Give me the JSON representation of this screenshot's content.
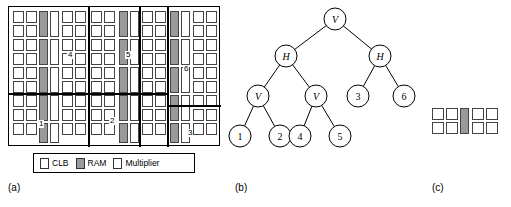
{
  "figure": {
    "captions": {
      "a": "(a)",
      "b": "(b)",
      "c": "(c)"
    }
  },
  "panel_a": {
    "legend": {
      "items": [
        {
          "key": "clb",
          "label": "CLB",
          "color": "#ffffff"
        },
        {
          "key": "ram",
          "label": "RAM",
          "color": "#9a9a9a"
        },
        {
          "key": "multiplier",
          "label": "Multiplier",
          "color": "#ffffff"
        }
      ]
    },
    "region_labels": [
      "1",
      "2",
      "3",
      "4",
      "5",
      "6"
    ]
  },
  "panel_b": {
    "type": "binary-slicing-tree",
    "nodes": [
      {
        "id": "n0",
        "label": "V",
        "italic": true,
        "cx": 107,
        "cy": 15
      },
      {
        "id": "n1",
        "label": "H",
        "italic": true,
        "cx": 58,
        "cy": 52
      },
      {
        "id": "n2",
        "label": "H",
        "italic": true,
        "cx": 152,
        "cy": 52
      },
      {
        "id": "n3",
        "label": "V",
        "italic": true,
        "cx": 30,
        "cy": 92
      },
      {
        "id": "n4",
        "label": "V",
        "italic": true,
        "cx": 88,
        "cy": 92
      },
      {
        "id": "n5",
        "label": "3",
        "italic": false,
        "cx": 130,
        "cy": 92
      },
      {
        "id": "n6",
        "label": "6",
        "italic": false,
        "cx": 176,
        "cy": 92
      },
      {
        "id": "n7",
        "label": "1",
        "italic": false,
        "cx": 12,
        "cy": 132
      },
      {
        "id": "n8",
        "label": "2",
        "italic": false,
        "cx": 52,
        "cy": 132
      },
      {
        "id": "n9",
        "label": "4",
        "italic": false,
        "cx": 72,
        "cy": 132
      },
      {
        "id": "n10",
        "label": "5",
        "italic": false,
        "cx": 112,
        "cy": 132
      }
    ],
    "edges": [
      [
        "n0",
        "n1"
      ],
      [
        "n0",
        "n2"
      ],
      [
        "n1",
        "n3"
      ],
      [
        "n1",
        "n4"
      ],
      [
        "n2",
        "n5"
      ],
      [
        "n2",
        "n6"
      ],
      [
        "n3",
        "n7"
      ],
      [
        "n3",
        "n8"
      ],
      [
        "n4",
        "n9"
      ],
      [
        "n4",
        "n10"
      ]
    ]
  },
  "panel_c": {
    "description": "small resource block group",
    "columns": [
      {
        "type": "clb",
        "count": 2
      },
      {
        "type": "ram",
        "count": 1
      },
      {
        "type": "clb",
        "count": 2
      }
    ]
  }
}
